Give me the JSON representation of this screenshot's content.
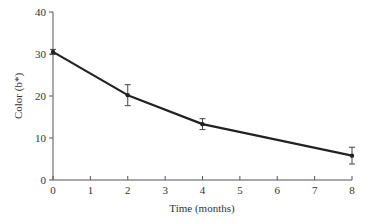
{
  "chart_data": {
    "type": "line",
    "title": "",
    "xlabel": "Time (months)",
    "ylabel": "Color (b*)",
    "xlim": [
      0,
      8
    ],
    "ylim": [
      0,
      40
    ],
    "x_ticks": [
      0,
      1,
      2,
      3,
      4,
      5,
      6,
      7,
      8
    ],
    "y_ticks": [
      0,
      10,
      20,
      30,
      40
    ],
    "grid": false,
    "legend": null,
    "series": [
      {
        "name": "Color (b*)",
        "x": [
          0,
          2,
          4,
          8
        ],
        "values": [
          30.5,
          20.2,
          13.3,
          5.8
        ],
        "error": [
          0.6,
          2.5,
          1.3,
          2.0
        ],
        "color": "#222222"
      }
    ]
  }
}
